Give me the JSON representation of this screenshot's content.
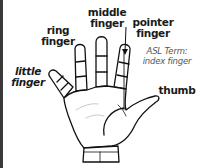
{
  "diagram": {
    "labels": {
      "middle": [
        "middle",
        "finger"
      ],
      "ring": [
        "ring",
        "finger"
      ],
      "pointer": [
        "pointer",
        "finger"
      ],
      "little": [
        "little",
        "finger"
      ],
      "thumb": "thumb",
      "asl_term": [
        "ASL Term:",
        "index finger"
      ]
    },
    "colors": {
      "line": "#111111",
      "text": "#1a1a1a",
      "note": "#555555",
      "border": "#3a3a3a"
    }
  }
}
